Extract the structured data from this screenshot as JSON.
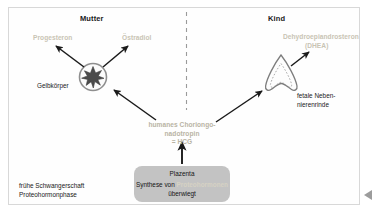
{
  "figure": {
    "title_left": "Mutter",
    "title_right": "Kind",
    "divider": "dashed-vertical"
  },
  "maternal": {
    "hormone_progesterone": "Progesteron",
    "hormone_estradiol": "Östradiol",
    "organ_label": "Gelbkörper",
    "organ_icon": "corpus-luteum-star-circle"
  },
  "fetal": {
    "hormone_dhea_line1": "Dehydroepiandrosteron",
    "hormone_dhea_line2": "(DHEA)",
    "organ_label_line1": "fetale Neben-",
    "organ_label_line2": "nierenrinde",
    "organ_icon": "fetal-adrenal-cortex"
  },
  "center": {
    "line1": "humanes Choriongo-",
    "line2": "nadotropin",
    "line3": "= HCG"
  },
  "placenta": {
    "title": "Plazenta",
    "line2_prefix": "Synthese von ",
    "line2_highlight": "Proteohormonen",
    "line3": "überwiegt"
  },
  "phase": {
    "line1": "frühe Schwangerschaft",
    "line2": "Proteohormonphase"
  },
  "colors": {
    "frame_border": "#d8d8d8",
    "background": "#ffffff",
    "hormone_text": "#c9c4b4",
    "organ_text": "#1a1a1a",
    "placenta_fill": "#c3c3c3",
    "arrow": "#1a1a1a",
    "divider": "#9a9a9a"
  }
}
